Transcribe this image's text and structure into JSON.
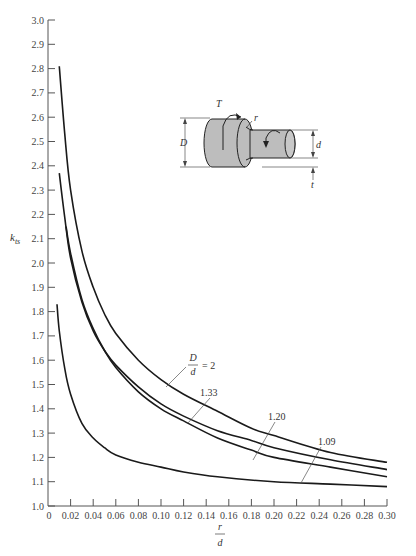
{
  "chart_data": {
    "type": "line",
    "title": "",
    "xlabel": "r/d",
    "xlabel_num": "r",
    "xlabel_den": "d",
    "ylabel": "k_ts",
    "ylabel_main": "k",
    "ylabel_sub": "ts",
    "xlim": [
      0,
      0.3
    ],
    "ylim": [
      1.0,
      3.0
    ],
    "grid": false,
    "legend_position": "inline labels with leader lines",
    "x_ticks": [
      0,
      0.02,
      0.04,
      0.06,
      0.08,
      0.1,
      0.12,
      0.14,
      0.16,
      0.18,
      0.2,
      0.22,
      0.24,
      0.26,
      0.28,
      0.3
    ],
    "x_tick_labels": [
      "0",
      "0.02",
      "0.04",
      "0.06",
      "0.08",
      "0.10",
      "0.12",
      "0.14",
      "0.16",
      "0.18",
      "0.20",
      "0.22",
      "0.24",
      "0.26",
      "0.28",
      "0.30"
    ],
    "y_ticks": [
      1.0,
      1.1,
      1.2,
      1.3,
      1.4,
      1.5,
      1.6,
      1.7,
      1.8,
      1.9,
      2.0,
      2.1,
      2.2,
      2.3,
      2.4,
      2.5,
      2.6,
      2.7,
      2.8,
      2.9,
      3.0
    ],
    "y_tick_labels": [
      "1.0",
      "1.1",
      "1.2",
      "1.3",
      "1.4",
      "1.5",
      "1.6",
      "1.7",
      "1.8",
      "1.9",
      "2.0",
      "2.1",
      "2.2",
      "2.3",
      "2.4",
      "2.5",
      "2.6",
      "2.7",
      "2.8",
      "2.9",
      "3.0"
    ],
    "series": [
      {
        "name": "D/d = 2",
        "label": "= 2",
        "x": [
          0.01,
          0.015,
          0.02,
          0.03,
          0.04,
          0.05,
          0.06,
          0.08,
          0.1,
          0.12,
          0.15,
          0.18,
          0.2,
          0.25,
          0.3
        ],
        "values": [
          2.81,
          2.52,
          2.3,
          2.05,
          1.9,
          1.79,
          1.71,
          1.6,
          1.52,
          1.46,
          1.39,
          1.32,
          1.29,
          1.22,
          1.18
        ]
      },
      {
        "name": "D/d = 1.33",
        "label": "1.33",
        "x": [
          0.01,
          0.015,
          0.02,
          0.03,
          0.04,
          0.05,
          0.06,
          0.08,
          0.1,
          0.12,
          0.15,
          0.18,
          0.2,
          0.25,
          0.3
        ],
        "values": [
          2.37,
          2.18,
          2.02,
          1.84,
          1.72,
          1.64,
          1.58,
          1.49,
          1.42,
          1.37,
          1.31,
          1.27,
          1.24,
          1.19,
          1.15
        ]
      },
      {
        "name": "D/d = 1.20",
        "label": "1.20",
        "x": [
          0.016,
          0.02,
          0.03,
          0.04,
          0.05,
          0.06,
          0.08,
          0.1,
          0.12,
          0.15,
          0.18,
          0.2,
          0.25,
          0.3
        ],
        "values": [
          2.15,
          2.04,
          1.85,
          1.73,
          1.64,
          1.57,
          1.47,
          1.4,
          1.35,
          1.28,
          1.23,
          1.2,
          1.16,
          1.12
        ]
      },
      {
        "name": "D/d = 1.09",
        "label": "1.09",
        "x": [
          0.008,
          0.01,
          0.015,
          0.02,
          0.03,
          0.04,
          0.05,
          0.06,
          0.08,
          0.1,
          0.12,
          0.15,
          0.2,
          0.25,
          0.3
        ],
        "values": [
          1.83,
          1.72,
          1.56,
          1.46,
          1.34,
          1.28,
          1.24,
          1.21,
          1.18,
          1.16,
          1.14,
          1.12,
          1.1,
          1.09,
          1.08
        ]
      }
    ],
    "annotations": {
      "d2_label_fraction_num": "D",
      "d2_label_fraction_den": "d",
      "d2_label_suffix": "= 2",
      "inset_labels": {
        "torque": "T",
        "radius": "r",
        "large_diameter": "D",
        "small_diameter": "d",
        "shoulder_height": "t"
      }
    }
  }
}
